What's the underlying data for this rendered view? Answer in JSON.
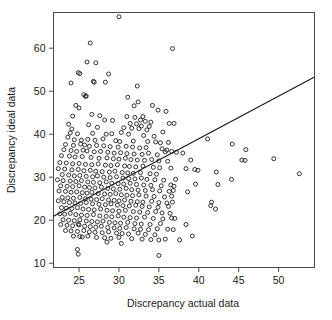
{
  "figure": {
    "background_color": "#ffffff",
    "marker_color": "#1c1c1c",
    "line_color": "#181818",
    "axis_color": "#4a4a4a"
  },
  "axes": {
    "x_title": "Discrepancy actual data",
    "y_title": "Discrepancy ideal data",
    "x_ticks": [
      "25",
      "30",
      "35",
      "40",
      "45",
      "50"
    ],
    "y_ticks": [
      "60",
      "50",
      "40",
      "30",
      "20",
      "10"
    ]
  },
  "chart_data": {
    "type": "scatter",
    "title": "",
    "xlabel": "Discrepancy actual data",
    "ylabel": "Discrepancy ideal data",
    "xlim": [
      21.8,
      54.5
    ],
    "ylim": [
      9.0,
      68.3
    ],
    "xticks": [
      25,
      30,
      35,
      40,
      45,
      50
    ],
    "yticks": [
      10,
      20,
      30,
      40,
      50,
      60
    ],
    "grid": false,
    "legend": null,
    "marker": "open-circle",
    "trendline": {
      "type": "line",
      "x": [
        21.8,
        54.5
      ],
      "y": [
        20.9,
        53.3
      ],
      "slope": 0.99,
      "intercept": -0.7
    },
    "points": [
      [
        30.0,
        67.3
      ],
      [
        26.4,
        61.2
      ],
      [
        36.7,
        59.9
      ],
      [
        26.0,
        56.8
      ],
      [
        27.1,
        56.6
      ],
      [
        24.9,
        54.3
      ],
      [
        25.1,
        54.1
      ],
      [
        28.7,
        54.0
      ],
      [
        26.8,
        52.3
      ],
      [
        26.9,
        52.1
      ],
      [
        24.0,
        51.9
      ],
      [
        28.3,
        52.1
      ],
      [
        32.3,
        51.2
      ],
      [
        25.6,
        49.2
      ],
      [
        25.9,
        48.9
      ],
      [
        25.8,
        48.8
      ],
      [
        31.1,
        48.6
      ],
      [
        24.6,
        46.7
      ],
      [
        25.0,
        46.1
      ],
      [
        31.9,
        46.6
      ],
      [
        34.2,
        46.7
      ],
      [
        32.4,
        47.5
      ],
      [
        34.9,
        45.6
      ],
      [
        35.9,
        45.3
      ],
      [
        24.2,
        44.2
      ],
      [
        26.6,
        44.6
      ],
      [
        27.6,
        44.3
      ],
      [
        31.0,
        44.1
      ],
      [
        32.0,
        43.9
      ],
      [
        33.0,
        44.1
      ],
      [
        28.2,
        43.3
      ],
      [
        29.2,
        43.2
      ],
      [
        32.7,
        43.3
      ],
      [
        33.3,
        43.0
      ],
      [
        34.0,
        42.8
      ],
      [
        36.3,
        42.5
      ],
      [
        36.9,
        42.5
      ],
      [
        23.7,
        42.3
      ],
      [
        26.2,
        42.2
      ],
      [
        31.4,
        42.5
      ],
      [
        32.2,
        42.4
      ],
      [
        32.8,
        41.9
      ],
      [
        33.8,
        41.8
      ],
      [
        24.1,
        41.2
      ],
      [
        27.3,
        41.6
      ],
      [
        30.6,
        41.5
      ],
      [
        31.6,
        41.4
      ],
      [
        32.5,
        41.3
      ],
      [
        33.5,
        41.0
      ],
      [
        35.5,
        40.5
      ],
      [
        23.9,
        40.3
      ],
      [
        24.8,
        40.1
      ],
      [
        26.7,
        40.2
      ],
      [
        28.4,
        40.0
      ],
      [
        29.1,
        40.1
      ],
      [
        30.3,
        40.4
      ],
      [
        31.2,
        40.0
      ],
      [
        33.1,
        39.7
      ],
      [
        34.4,
        39.5
      ],
      [
        41.1,
        38.9
      ],
      [
        23.6,
        39.3
      ],
      [
        24.4,
        38.7
      ],
      [
        25.3,
        38.6
      ],
      [
        26.1,
        38.8
      ],
      [
        27.0,
        38.6
      ],
      [
        28.0,
        38.9
      ],
      [
        29.6,
        38.5
      ],
      [
        30.1,
        38.3
      ],
      [
        31.8,
        38.4
      ],
      [
        33.6,
        38.3
      ],
      [
        34.6,
        38.2
      ],
      [
        35.2,
        38.0
      ],
      [
        36.2,
        38.1
      ],
      [
        44.2,
        37.7
      ],
      [
        23.3,
        37.6
      ],
      [
        24.3,
        37.4
      ],
      [
        25.2,
        37.7
      ],
      [
        25.7,
        37.5
      ],
      [
        26.3,
        37.2
      ],
      [
        27.2,
        37.4
      ],
      [
        28.1,
        37.3
      ],
      [
        28.9,
        37.1
      ],
      [
        29.9,
        37.0
      ],
      [
        30.9,
        37.2
      ],
      [
        31.7,
        37.0
      ],
      [
        32.6,
        36.8
      ],
      [
        33.4,
        36.9
      ],
      [
        35.4,
        36.6
      ],
      [
        36.0,
        36.3
      ],
      [
        36.6,
        36.0
      ],
      [
        45.9,
        36.4
      ],
      [
        23.1,
        36.4
      ],
      [
        24.0,
        36.2
      ],
      [
        24.7,
        36.0
      ],
      [
        25.5,
        36.3
      ],
      [
        26.0,
        36.1
      ],
      [
        26.9,
        35.9
      ],
      [
        27.7,
        36.0
      ],
      [
        28.6,
        35.8
      ],
      [
        29.4,
        35.6
      ],
      [
        30.2,
        35.7
      ],
      [
        31.0,
        35.5
      ],
      [
        31.9,
        35.4
      ],
      [
        32.9,
        35.3
      ],
      [
        33.7,
        35.6
      ],
      [
        34.8,
        35.2
      ],
      [
        35.8,
        35.9
      ],
      [
        37.2,
        35.8
      ],
      [
        38.0,
        35.6
      ],
      [
        22.8,
        35.0
      ],
      [
        23.8,
        34.9
      ],
      [
        24.5,
        34.7
      ],
      [
        25.4,
        34.8
      ],
      [
        26.5,
        34.6
      ],
      [
        27.5,
        34.4
      ],
      [
        28.5,
        34.5
      ],
      [
        29.3,
        34.3
      ],
      [
        30.0,
        34.2
      ],
      [
        30.8,
        34.4
      ],
      [
        31.5,
        34.1
      ],
      [
        32.3,
        34.0
      ],
      [
        33.2,
        33.9
      ],
      [
        34.1,
        34.1
      ],
      [
        35.0,
        33.8
      ],
      [
        36.1,
        33.7
      ],
      [
        39.0,
        34.0
      ],
      [
        45.4,
        34.0
      ],
      [
        45.8,
        33.9
      ],
      [
        49.4,
        34.3
      ],
      [
        22.6,
        33.4
      ],
      [
        23.4,
        33.3
      ],
      [
        24.2,
        33.1
      ],
      [
        25.0,
        33.2
      ],
      [
        25.8,
        33.0
      ],
      [
        26.6,
        32.9
      ],
      [
        27.4,
        33.1
      ],
      [
        28.3,
        32.8
      ],
      [
        29.0,
        32.7
      ],
      [
        29.8,
        32.9
      ],
      [
        30.7,
        32.6
      ],
      [
        31.3,
        32.5
      ],
      [
        32.1,
        32.4
      ],
      [
        33.0,
        32.6
      ],
      [
        34.3,
        32.3
      ],
      [
        35.1,
        32.2
      ],
      [
        36.5,
        32.1
      ],
      [
        38.4,
        32.0
      ],
      [
        39.5,
        31.8
      ],
      [
        39.9,
        31.6
      ],
      [
        22.4,
        32.0
      ],
      [
        23.2,
        31.9
      ],
      [
        24.1,
        31.7
      ],
      [
        24.9,
        31.8
      ],
      [
        25.6,
        31.5
      ],
      [
        26.4,
        31.6
      ],
      [
        27.1,
        31.4
      ],
      [
        27.9,
        31.3
      ],
      [
        28.8,
        31.2
      ],
      [
        29.5,
        31.4
      ],
      [
        30.4,
        31.1
      ],
      [
        31.1,
        31.0
      ],
      [
        31.8,
        30.9
      ],
      [
        32.7,
        31.1
      ],
      [
        33.9,
        30.8
      ],
      [
        34.7,
        30.7
      ],
      [
        42.2,
        31.2
      ],
      [
        52.6,
        30.8
      ],
      [
        22.9,
        30.6
      ],
      [
        23.7,
        30.5
      ],
      [
        24.4,
        30.3
      ],
      [
        25.1,
        30.4
      ],
      [
        25.9,
        30.2
      ],
      [
        26.7,
        30.1
      ],
      [
        27.3,
        30.3
      ],
      [
        28.1,
        30.0
      ],
      [
        28.9,
        29.9
      ],
      [
        29.7,
        30.1
      ],
      [
        30.5,
        29.8
      ],
      [
        31.2,
        29.7
      ],
      [
        32.0,
        29.6
      ],
      [
        32.8,
        29.8
      ],
      [
        33.5,
        29.5
      ],
      [
        34.5,
        29.4
      ],
      [
        35.6,
        29.3
      ],
      [
        37.1,
        29.5
      ],
      [
        44.1,
        29.5
      ],
      [
        22.3,
        29.4
      ],
      [
        23.0,
        29.2
      ],
      [
        23.9,
        29.1
      ],
      [
        24.6,
        29.0
      ],
      [
        25.3,
        29.2
      ],
      [
        26.1,
        28.9
      ],
      [
        26.8,
        28.8
      ],
      [
        27.6,
        28.7
      ],
      [
        28.4,
        28.9
      ],
      [
        29.1,
        28.6
      ],
      [
        29.9,
        28.5
      ],
      [
        30.6,
        28.4
      ],
      [
        31.4,
        28.6
      ],
      [
        32.2,
        28.3
      ],
      [
        33.1,
        28.2
      ],
      [
        34.0,
        28.1
      ],
      [
        35.3,
        28.0
      ],
      [
        36.5,
        28.2
      ],
      [
        36.9,
        27.9
      ],
      [
        39.6,
        28.4
      ],
      [
        42.4,
        28.3
      ],
      [
        22.7,
        28.0
      ],
      [
        23.5,
        27.9
      ],
      [
        24.2,
        27.8
      ],
      [
        25.0,
        28.0
      ],
      [
        25.7,
        27.7
      ],
      [
        26.3,
        27.6
      ],
      [
        27.0,
        27.5
      ],
      [
        27.8,
        27.7
      ],
      [
        28.6,
        27.4
      ],
      [
        29.3,
        27.3
      ],
      [
        30.1,
        27.2
      ],
      [
        30.9,
        27.4
      ],
      [
        31.6,
        27.1
      ],
      [
        32.4,
        27.0
      ],
      [
        33.3,
        26.9
      ],
      [
        34.2,
        27.1
      ],
      [
        35.1,
        26.8
      ],
      [
        36.3,
        26.7
      ],
      [
        36.8,
        26.9
      ],
      [
        38.6,
        26.6
      ],
      [
        22.5,
        26.8
      ],
      [
        23.3,
        26.7
      ],
      [
        24.0,
        26.5
      ],
      [
        24.7,
        26.6
      ],
      [
        25.4,
        26.4
      ],
      [
        26.0,
        26.3
      ],
      [
        26.6,
        26.5
      ],
      [
        27.4,
        26.2
      ],
      [
        28.2,
        26.1
      ],
      [
        28.9,
        26.0
      ],
      [
        29.6,
        26.2
      ],
      [
        30.3,
        25.9
      ],
      [
        31.0,
        25.8
      ],
      [
        31.7,
        25.7
      ],
      [
        32.5,
        25.9
      ],
      [
        33.4,
        25.6
      ],
      [
        34.4,
        25.5
      ],
      [
        35.7,
        25.4
      ],
      [
        36.6,
        25.6
      ],
      [
        22.9,
        25.3
      ],
      [
        23.6,
        25.2
      ],
      [
        24.3,
        25.1
      ],
      [
        25.1,
        25.3
      ],
      [
        25.8,
        25.0
      ],
      [
        26.5,
        24.9
      ],
      [
        27.2,
        24.8
      ],
      [
        27.9,
        25.0
      ],
      [
        28.7,
        24.7
      ],
      [
        29.4,
        24.6
      ],
      [
        30.0,
        24.5
      ],
      [
        30.7,
        24.7
      ],
      [
        31.5,
        24.4
      ],
      [
        32.3,
        24.3
      ],
      [
        33.0,
        24.2
      ],
      [
        34.1,
        24.4
      ],
      [
        35.0,
        24.1
      ],
      [
        36.0,
        24.0
      ],
      [
        36.7,
        24.2
      ],
      [
        41.6,
        24.2
      ],
      [
        22.4,
        24.5
      ],
      [
        23.1,
        24.3
      ],
      [
        23.8,
        24.1
      ],
      [
        24.5,
        24.0
      ],
      [
        25.2,
        23.9
      ],
      [
        25.9,
        24.1
      ],
      [
        26.7,
        23.8
      ],
      [
        27.5,
        23.7
      ],
      [
        28.3,
        23.6
      ],
      [
        29.0,
        23.8
      ],
      [
        29.8,
        23.5
      ],
      [
        30.5,
        23.4
      ],
      [
        31.3,
        23.3
      ],
      [
        32.1,
        23.5
      ],
      [
        32.9,
        23.2
      ],
      [
        33.8,
        23.1
      ],
      [
        34.9,
        23.0
      ],
      [
        36.2,
        23.2
      ],
      [
        41.5,
        23.4
      ],
      [
        42.1,
        22.6
      ],
      [
        22.8,
        22.9
      ],
      [
        23.4,
        22.8
      ],
      [
        24.1,
        22.7
      ],
      [
        24.8,
        22.9
      ],
      [
        25.5,
        22.6
      ],
      [
        26.2,
        22.5
      ],
      [
        26.9,
        22.4
      ],
      [
        27.7,
        22.6
      ],
      [
        28.5,
        22.3
      ],
      [
        29.2,
        22.2
      ],
      [
        30.0,
        22.1
      ],
      [
        30.8,
        22.3
      ],
      [
        31.8,
        22.0
      ],
      [
        32.6,
        21.9
      ],
      [
        33.6,
        21.8
      ],
      [
        34.6,
        22.0
      ],
      [
        35.4,
        21.7
      ],
      [
        36.4,
        21.6
      ],
      [
        22.6,
        21.5
      ],
      [
        23.2,
        21.4
      ],
      [
        23.9,
        21.6
      ],
      [
        24.6,
        21.3
      ],
      [
        25.3,
        21.2
      ],
      [
        26.0,
        21.1
      ],
      [
        26.8,
        21.3
      ],
      [
        27.6,
        21.0
      ],
      [
        28.4,
        20.9
      ],
      [
        29.1,
        20.8
      ],
      [
        29.9,
        21.0
      ],
      [
        30.6,
        20.7
      ],
      [
        31.4,
        20.6
      ],
      [
        32.2,
        20.5
      ],
      [
        33.2,
        20.7
      ],
      [
        34.3,
        20.4
      ],
      [
        35.5,
        20.3
      ],
      [
        36.6,
        20.5
      ],
      [
        37.0,
        20.4
      ],
      [
        38.4,
        19.0
      ],
      [
        23.0,
        20.1
      ],
      [
        23.7,
        20.0
      ],
      [
        24.4,
        19.9
      ],
      [
        25.1,
        20.1
      ],
      [
        25.9,
        19.8
      ],
      [
        26.6,
        19.7
      ],
      [
        27.3,
        19.6
      ],
      [
        28.0,
        19.8
      ],
      [
        28.8,
        19.5
      ],
      [
        29.5,
        19.4
      ],
      [
        30.2,
        19.3
      ],
      [
        31.1,
        19.5
      ],
      [
        32.0,
        19.2
      ],
      [
        32.8,
        19.1
      ],
      [
        33.9,
        19.0
      ],
      [
        35.2,
        19.2
      ],
      [
        24.9,
        19.1
      ],
      [
        22.7,
        19.0
      ],
      [
        23.5,
        18.8
      ],
      [
        24.2,
        18.7
      ],
      [
        25.0,
        18.9
      ],
      [
        25.7,
        18.6
      ],
      [
        26.4,
        18.5
      ],
      [
        27.1,
        18.4
      ],
      [
        27.8,
        18.6
      ],
      [
        28.6,
        18.3
      ],
      [
        29.4,
        18.2
      ],
      [
        30.1,
        18.1
      ],
      [
        30.9,
        18.3
      ],
      [
        31.9,
        18.0
      ],
      [
        32.7,
        17.9
      ],
      [
        33.7,
        17.8
      ],
      [
        34.8,
        18.0
      ],
      [
        36.1,
        17.9
      ],
      [
        36.8,
        17.8
      ],
      [
        23.3,
        17.6
      ],
      [
        24.0,
        17.5
      ],
      [
        24.8,
        17.4
      ],
      [
        25.6,
        17.6
      ],
      [
        26.3,
        17.3
      ],
      [
        27.0,
        17.2
      ],
      [
        27.9,
        17.1
      ],
      [
        28.7,
        17.3
      ],
      [
        29.7,
        17.0
      ],
      [
        30.4,
        16.9
      ],
      [
        31.2,
        16.8
      ],
      [
        32.4,
        17.0
      ],
      [
        33.3,
        16.7
      ],
      [
        34.5,
        16.6
      ],
      [
        39.2,
        16.3
      ],
      [
        24.3,
        16.3
      ],
      [
        25.1,
        16.2
      ],
      [
        25.4,
        16.1
      ],
      [
        26.1,
        16.3
      ],
      [
        27.2,
        16.0
      ],
      [
        28.2,
        15.9
      ],
      [
        29.0,
        15.8
      ],
      [
        30.0,
        16.0
      ],
      [
        31.6,
        15.7
      ],
      [
        32.9,
        15.6
      ],
      [
        34.0,
        15.5
      ],
      [
        35.0,
        15.4
      ],
      [
        35.8,
        15.6
      ],
      [
        37.6,
        15.4
      ],
      [
        28.5,
        14.9
      ],
      [
        30.3,
        14.6
      ],
      [
        24.8,
        13.2
      ],
      [
        24.9,
        12.1
      ],
      [
        35.0,
        11.8
      ]
    ]
  }
}
